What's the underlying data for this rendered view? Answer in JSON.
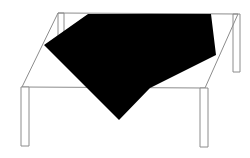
{
  "scene": {
    "title": "Table with draped black cloth",
    "width": 250,
    "height": 158,
    "background_color": "#ffffff",
    "line_color": "#8c8c8c",
    "cloth_color": "#000000",
    "alt_text": "Line drawing of a four legged table seen in perspective with a large solid black square cloth draped over its top"
  },
  "table": {
    "name": "table",
    "top_surface": {
      "name": "tabletop",
      "shape": "parallelogram",
      "points": "58,13 238,14 205,88 22,87"
    },
    "legs": [
      {
        "name": "leg-front-left",
        "points": "21,87 29,87 29,146 21,146"
      },
      {
        "name": "leg-front-right",
        "points": "200,88 208,88 208,147 200,147"
      },
      {
        "name": "leg-back-right",
        "points": "233,14 240,14 240,72 233,72"
      },
      {
        "name": "leg-back-left",
        "points": "58,13 64,13 64,40 58,40"
      }
    ]
  },
  "cloth": {
    "name": "black-cloth",
    "color": "#000000",
    "shape": "draped-square",
    "points": "88,14 211,14 216,55 150,88 119,120 44,45",
    "description": "Solid black square cloth rotated and draped over the tabletop"
  },
  "labels": {
    "scene_label": "",
    "caption": ""
  }
}
